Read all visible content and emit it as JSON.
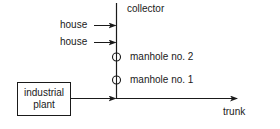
{
  "diagram": {
    "type": "sewer-network-schematic",
    "colors": {
      "line": "#1a1a1a",
      "background": "#ffffff"
    },
    "labels": {
      "collector": "collector",
      "house_1": "house",
      "house_2": "house",
      "manhole_2": "manhole no. 2",
      "manhole_1": "manhole no. 1",
      "plant_line1": "industrial",
      "plant_line2": "plant",
      "trunk": "trunk"
    },
    "nodes": [
      {
        "id": "house_1",
        "label": "house",
        "kind": "source"
      },
      {
        "id": "house_2",
        "label": "house",
        "kind": "source"
      },
      {
        "id": "industrial_plant",
        "label": "industrial plant",
        "kind": "source-box"
      },
      {
        "id": "manhole_2",
        "label": "manhole no. 2",
        "kind": "manhole"
      },
      {
        "id": "manhole_1",
        "label": "manhole no. 1",
        "kind": "manhole"
      },
      {
        "id": "collector",
        "label": "collector",
        "kind": "pipe"
      },
      {
        "id": "trunk",
        "label": "trunk",
        "kind": "pipe"
      }
    ],
    "edges": [
      {
        "from": "house_1",
        "to": "collector"
      },
      {
        "from": "house_2",
        "to": "collector"
      },
      {
        "from": "collector",
        "to": "trunk"
      },
      {
        "from": "industrial_plant",
        "to": "trunk"
      }
    ]
  }
}
